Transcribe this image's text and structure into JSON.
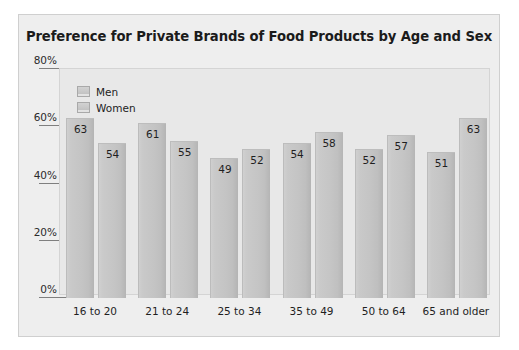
{
  "chart_data": {
    "type": "bar",
    "title": "Preference for Private Brands of Food Products by Age and Sex",
    "xlabel": "",
    "ylabel": "",
    "ylim": [
      0,
      80
    ],
    "ytick_labels": [
      "0%",
      "20%",
      "40%",
      "60%",
      "80%"
    ],
    "ytick_values": [
      0,
      20,
      40,
      60,
      80
    ],
    "grid": false,
    "legend_position": "top-left-inside",
    "categories": [
      "16 to 20",
      "21 to 24",
      "25 to 34",
      "35 to 49",
      "50 to 64",
      "65 and older"
    ],
    "series": [
      {
        "name": "Men",
        "values": [
          63,
          61,
          49,
          54,
          52,
          51
        ]
      },
      {
        "name": "Women",
        "values": [
          54,
          55,
          52,
          58,
          57,
          63
        ]
      }
    ]
  },
  "colors": {
    "page_background": "#ffffff",
    "frame_background": "#eeeeee",
    "plot_background": "#e8e8e8",
    "frame_border": "#cfcfcf",
    "bar_fill": "#c6c6c6",
    "bar_shadow": "#b4b4b4",
    "tick_line": "#7f7f7f",
    "text": "#1f1f1f",
    "title_text": "#1b1b1b"
  }
}
